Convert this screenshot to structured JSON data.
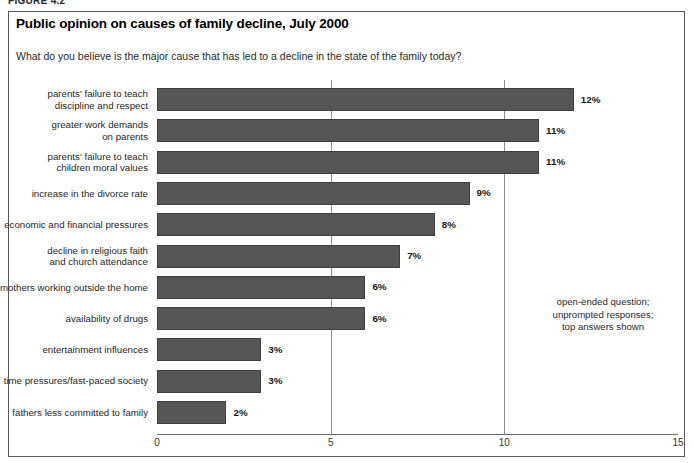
{
  "figure_caption": "FIGURE 4.2",
  "chart_note": "open-ended question;\nunprompted responses;\ntop answers shown",
  "chart_data": {
    "type": "bar",
    "orientation": "horizontal",
    "title": "Public opinion on causes of family decline, July 2000",
    "subtitle": "What do you believe is the major cause that has led to a decline in the state of the family today?",
    "xlabel": "",
    "ylabel": "",
    "xlim": [
      0,
      15
    ],
    "xticks": [
      "0",
      "5",
      "10",
      "15"
    ],
    "xtick_values": [
      0,
      5,
      10,
      15
    ],
    "grid": "vertical gridlines at 5 and 10",
    "legend": "none",
    "bar_color": "#565656",
    "value_suffix": "%",
    "categories": [
      "parents' failure to teach\ndiscipline and respect",
      "greater work demands\non parents",
      "parents' failure to teach\nchildren moral values",
      "increase in the divorce rate",
      "economic and financial pressures",
      "decline in religious faith\nand church attendance",
      "mothers working outside the home",
      "availability of drugs",
      "entertainment influences",
      "time pressures/fast-paced society",
      "fathers less committed to family"
    ],
    "values": [
      12,
      11,
      11,
      9,
      8,
      7,
      6,
      6,
      3,
      3,
      2
    ],
    "value_labels": [
      "12%",
      "11%",
      "11%",
      "9%",
      "8%",
      "7%",
      "6%",
      "6%",
      "3%",
      "3%",
      "2%"
    ]
  }
}
